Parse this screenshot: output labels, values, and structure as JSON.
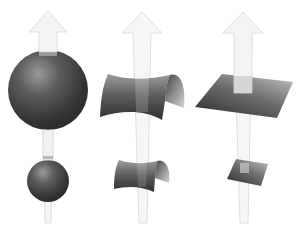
{
  "figure": {
    "columns": [
      {
        "id": "sphere",
        "label": "Sphere",
        "curvature": "positive",
        "arrow": {
          "cx": 48,
          "tip_y": 11,
          "head_base_y": 32,
          "head_half_width": 19,
          "shaft_top_half": 9,
          "shaft_bottom_half": 3,
          "bottom_y": 223
        },
        "large": {
          "cx": 48,
          "cy": 90,
          "r": 40
        },
        "small": {
          "cx": 48,
          "cy": 181,
          "r": 21
        }
      },
      {
        "id": "saddle",
        "label": "Saddle",
        "curvature": "negative",
        "arrow": {
          "cx": 142,
          "tip_y": 12,
          "head_base_y": 33,
          "head_half_width": 20,
          "shaft_top_half": 9,
          "shaft_bottom_half": 3,
          "bottom_y": 223
        }
      },
      {
        "id": "plane",
        "label": "Plane",
        "curvature": "zero",
        "arrow": {
          "cx": 243,
          "tip_y": 12,
          "head_base_y": 33,
          "head_half_width": 20,
          "shaft_top_half": 9,
          "shaft_bottom_half": 3,
          "bottom_y": 223
        }
      }
    ],
    "colors": {
      "arrow_fill": "#f4f4f4",
      "arrow_stroke": "#d8d8d8",
      "shape_dark": "#2e2e2e",
      "shape_mid": "#6a6a6a",
      "shape_light": "#bdbdbd",
      "background": "#ffffff"
    }
  }
}
